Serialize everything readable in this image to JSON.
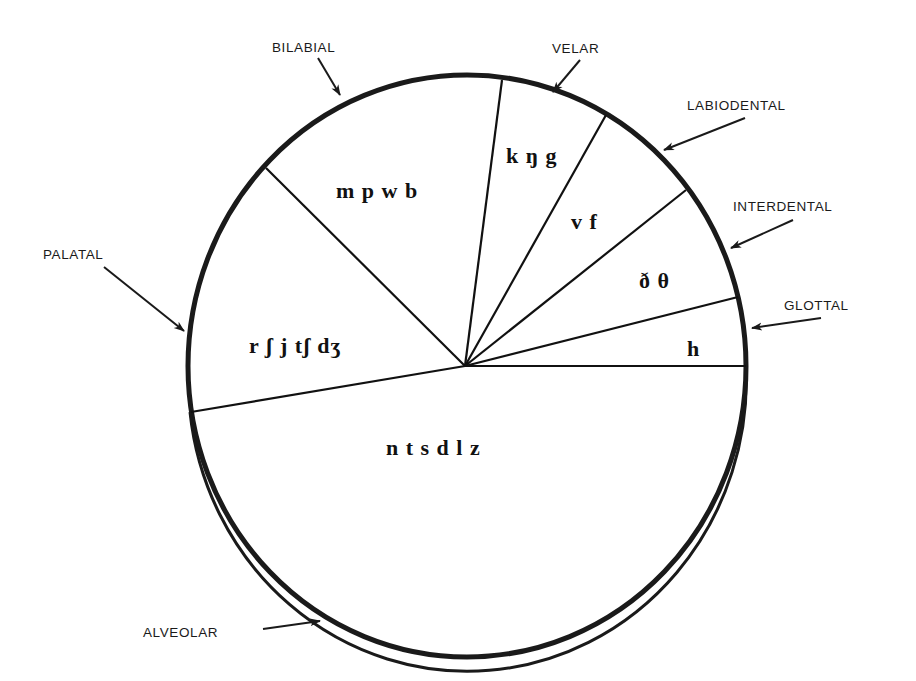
{
  "diagram": {
    "type": "pie-style phonetic diagram",
    "segments": [
      {
        "id": "bilabial",
        "label": "BILABIAL",
        "phones": "m p w b"
      },
      {
        "id": "velar",
        "label": "VELAR",
        "phones": "k ŋ g"
      },
      {
        "id": "labiodental",
        "label": "LABIODENTAL",
        "phones": "v f"
      },
      {
        "id": "interdental",
        "label": "INTERDENTAL",
        "phones": "ð θ"
      },
      {
        "id": "glottal",
        "label": "GLOTTAL",
        "phones": "h"
      },
      {
        "id": "alveolar",
        "label": "ALVEOLAR",
        "phones": "n t s d l z"
      },
      {
        "id": "palatal",
        "label": "PALATAL",
        "phones": "r ʃ j tʃ dʒ"
      }
    ],
    "colors": {
      "stroke": "#1a1a1a",
      "background": "#ffffff"
    }
  }
}
